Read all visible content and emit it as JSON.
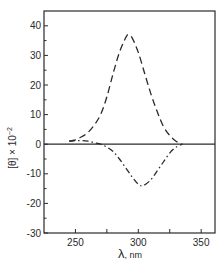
{
  "chart_data": {
    "type": "line",
    "title": "",
    "xlabel": "λ, nm",
    "ylabel": "[θ] × 10⁻²",
    "xlim": [
      225,
      361
    ],
    "ylim": [
      -30,
      45
    ],
    "x_ticks": [
      250,
      300,
      350
    ],
    "x_minor_ticks": [
      275,
      325
    ],
    "y_ticks": [
      40,
      30,
      20,
      10,
      0,
      -10,
      -20,
      -30
    ],
    "grid": false,
    "legend": null,
    "zero_line": true,
    "series": [
      {
        "name": "dashed",
        "style": "dashed",
        "x": [
          245,
          250,
          255,
          260,
          265,
          270,
          275,
          280,
          285,
          290,
          292,
          295,
          300,
          305,
          310,
          315,
          320,
          325,
          330,
          335
        ],
        "values": [
          1,
          1.5,
          2.5,
          4,
          6.5,
          10,
          16,
          24,
          31,
          36,
          37,
          36,
          31,
          24,
          17,
          11,
          6,
          3,
          1,
          0
        ]
      },
      {
        "name": "dash-dot",
        "style": "dash-dot",
        "x": [
          245,
          250,
          255,
          260,
          265,
          270,
          275,
          280,
          285,
          290,
          295,
          300,
          304,
          310,
          315,
          320,
          325,
          330,
          335
        ],
        "values": [
          1,
          1.2,
          1.2,
          1,
          0.5,
          0,
          -1,
          -2.5,
          -5,
          -8,
          -11,
          -13.5,
          -14,
          -12,
          -9,
          -6,
          -3,
          -1,
          0
        ]
      }
    ]
  },
  "axes": {
    "x_tick_labels": [
      "250",
      "300",
      "350"
    ],
    "y_tick_labels": [
      "40",
      "30",
      "20",
      "10",
      "0",
      "-10",
      "-20",
      "-30"
    ],
    "x_label_symbol": "λ",
    "x_label_unit": ", nm",
    "y_label_main": "[θ] × 10",
    "y_label_exp": "−2"
  }
}
